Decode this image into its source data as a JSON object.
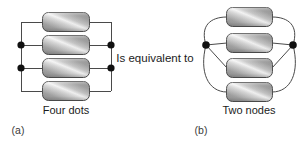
{
  "figure": {
    "title": "",
    "background_color": "#ffffff",
    "wire_color": "#4a4a4a",
    "node_color": "#111111",
    "resistor_border_color": "#4f4f4f",
    "resistor_gradient": [
      "#8e8e8e",
      "#b9b9b9",
      "#f2f2f2",
      "#a6a6a6",
      "#8a8a8a"
    ],
    "text_color": "#1b1b1b"
  },
  "middle": {
    "equivalence_label": "Is equivalent to"
  },
  "panel_a": {
    "caption": "Four dots",
    "sublabel": "(a)",
    "resistor_count": 4,
    "node_count": 4,
    "resistors": [
      {
        "name": "resistor-a-1"
      },
      {
        "name": "resistor-a-2"
      },
      {
        "name": "resistor-a-3"
      },
      {
        "name": "resistor-a-4"
      }
    ],
    "nodes": [
      {
        "name": "node-a-left-upper",
        "x": 21,
        "y": 45
      },
      {
        "name": "node-a-left-lower",
        "x": 21,
        "y": 68
      },
      {
        "name": "node-a-right-upper",
        "x": 111,
        "y": 45
      },
      {
        "name": "node-a-right-lower",
        "x": 111,
        "y": 68
      }
    ]
  },
  "panel_b": {
    "caption": "Two nodes",
    "sublabel": "(b)",
    "resistor_count": 4,
    "node_count": 2,
    "resistors": [
      {
        "name": "resistor-b-1"
      },
      {
        "name": "resistor-b-2"
      },
      {
        "name": "resistor-b-3"
      },
      {
        "name": "resistor-b-4"
      }
    ],
    "nodes": [
      {
        "name": "node-b-left",
        "x": 206,
        "y": 45
      },
      {
        "name": "node-b-right",
        "x": 293,
        "y": 45
      }
    ]
  }
}
